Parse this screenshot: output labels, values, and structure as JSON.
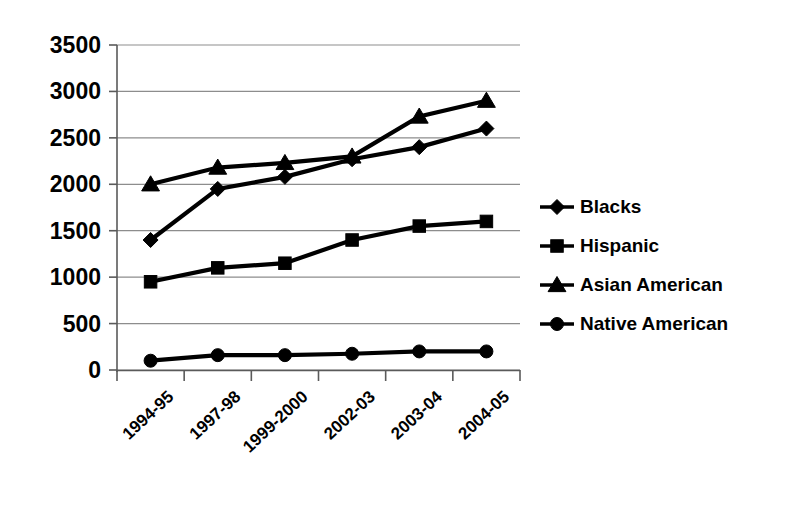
{
  "chart_data": {
    "type": "line",
    "title": "",
    "subtitle": "",
    "xlabel": "",
    "ylabel": "",
    "categories": [
      "1994-95",
      "1997-98",
      "1999-2000",
      "2002-03",
      "2003-04",
      "2004-05"
    ],
    "ylim": [
      0,
      3500
    ],
    "ytick_values": [
      0,
      500,
      1000,
      1500,
      2000,
      2500,
      3000,
      3500
    ],
    "ytick_labels": [
      "0",
      "500",
      "1000",
      "1500",
      "2000",
      "2500",
      "3000",
      "3500"
    ],
    "grid": true,
    "legend_position": "right",
    "series": [
      {
        "name": "Blacks",
        "marker": "diamond",
        "color": "#000000",
        "values": [
          1400,
          1950,
          2080,
          2270,
          2400,
          2600
        ]
      },
      {
        "name": "Hispanic",
        "marker": "square",
        "color": "#000000",
        "values": [
          950,
          1100,
          1150,
          1400,
          1550,
          1600
        ]
      },
      {
        "name": "Asian American",
        "marker": "triangle",
        "color": "#000000",
        "values": [
          2000,
          2180,
          2230,
          2300,
          2730,
          2900
        ]
      },
      {
        "name": "Native American",
        "marker": "circle",
        "color": "#000000",
        "values": [
          100,
          160,
          160,
          175,
          200,
          200
        ]
      }
    ]
  },
  "legend": {
    "items": [
      {
        "label": "Blacks",
        "marker": "diamond"
      },
      {
        "label": "Hispanic",
        "marker": "square"
      },
      {
        "label": "Asian American",
        "marker": "triangle"
      },
      {
        "label": "Native American",
        "marker": "circle"
      }
    ]
  },
  "colors": {
    "ink": "#000000",
    "grid": "#8d8d8d",
    "axis": "#5a5a5a",
    "background": "#ffffff"
  }
}
